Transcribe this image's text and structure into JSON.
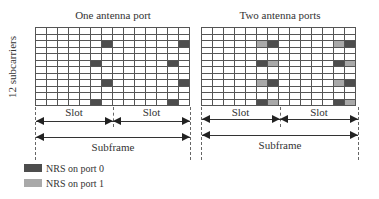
{
  "panels": [
    {
      "title": "One antenna port",
      "nrs": [
        {
          "row": 2,
          "col": 6,
          "port": 0
        },
        {
          "row": 2,
          "col": 13,
          "port": 0
        },
        {
          "row": 5,
          "col": 5,
          "port": 0
        },
        {
          "row": 5,
          "col": 12,
          "port": 0
        },
        {
          "row": 8,
          "col": 6,
          "port": 0
        },
        {
          "row": 8,
          "col": 13,
          "port": 0
        },
        {
          "row": 11,
          "col": 5,
          "port": 0
        },
        {
          "row": 11,
          "col": 12,
          "port": 0
        }
      ]
    },
    {
      "title": "Two antenna ports",
      "nrs": [
        {
          "row": 2,
          "col": 5,
          "port": 1
        },
        {
          "row": 2,
          "col": 6,
          "port": 0
        },
        {
          "row": 2,
          "col": 12,
          "port": 1
        },
        {
          "row": 2,
          "col": 13,
          "port": 0
        },
        {
          "row": 5,
          "col": 5,
          "port": 0
        },
        {
          "row": 5,
          "col": 6,
          "port": 1
        },
        {
          "row": 5,
          "col": 12,
          "port": 0
        },
        {
          "row": 5,
          "col": 13,
          "port": 1
        },
        {
          "row": 8,
          "col": 5,
          "port": 1
        },
        {
          "row": 8,
          "col": 6,
          "port": 0
        },
        {
          "row": 8,
          "col": 12,
          "port": 1
        },
        {
          "row": 8,
          "col": 13,
          "port": 0
        },
        {
          "row": 11,
          "col": 5,
          "port": 0
        },
        {
          "row": 11,
          "col": 6,
          "port": 1
        },
        {
          "row": 11,
          "col": 12,
          "port": 0
        },
        {
          "row": 11,
          "col": 13,
          "port": 1
        }
      ]
    }
  ],
  "grid": {
    "rows": 12,
    "cols": 14
  },
  "ylabel": "12 subcarriers",
  "labels": {
    "slot": "Slot",
    "subframe": "Subframe"
  },
  "legend": [
    {
      "label": "NRS on port 0",
      "color": "#4d4d4d"
    },
    {
      "label": "NRS on port 1",
      "color": "#a9a9a9"
    }
  ]
}
